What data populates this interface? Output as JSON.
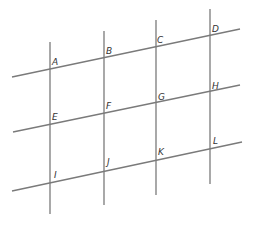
{
  "diagram": {
    "type": "skewed-grid-of-intersecting-lines",
    "line_color": "#7a7a7a",
    "label_color": "#333333",
    "vertical_lines": [
      {
        "id": "v1",
        "x": 50,
        "y1": 42,
        "y2": 214
      },
      {
        "id": "v2",
        "x": 104,
        "y1": 31,
        "y2": 205
      },
      {
        "id": "v3",
        "x": 156,
        "y1": 20,
        "y2": 195
      },
      {
        "id": "v4",
        "x": 210,
        "y1": 9,
        "y2": 184
      }
    ],
    "slanted_lines": [
      {
        "id": "h1",
        "x1": 12,
        "y1": 77,
        "x2": 240,
        "y2": 29
      },
      {
        "id": "h2",
        "x1": 13,
        "y1": 132,
        "x2": 240,
        "y2": 85
      },
      {
        "id": "h3",
        "x1": 12,
        "y1": 191,
        "x2": 242,
        "y2": 142
      }
    ],
    "points": [
      {
        "label": "A",
        "x": 50,
        "y": 69,
        "lx": 52,
        "ly": 65
      },
      {
        "label": "B",
        "x": 104,
        "y": 57,
        "lx": 106,
        "ly": 54
      },
      {
        "label": "C",
        "x": 156,
        "y": 47,
        "lx": 157,
        "ly": 43
      },
      {
        "label": "D",
        "x": 210,
        "y": 36,
        "lx": 212,
        "ly": 32
      },
      {
        "label": "E",
        "x": 50,
        "y": 123,
        "lx": 52,
        "ly": 120
      },
      {
        "label": "F",
        "x": 104,
        "y": 114,
        "lx": 106,
        "ly": 109
      },
      {
        "label": "G",
        "x": 157,
        "y": 103,
        "lx": 158,
        "ly": 100
      },
      {
        "label": "H",
        "x": 210,
        "y": 92,
        "lx": 212,
        "ly": 89
      },
      {
        "label": "I",
        "x": 51,
        "y": 182,
        "lx": 54,
        "ly": 178
      },
      {
        "label": "J",
        "x": 105,
        "y": 171,
        "lx": 107,
        "ly": 165
      },
      {
        "label": "K",
        "x": 157,
        "y": 159,
        "lx": 158,
        "ly": 155
      },
      {
        "label": "L",
        "x": 211,
        "y": 148,
        "lx": 213,
        "ly": 144
      }
    ]
  }
}
